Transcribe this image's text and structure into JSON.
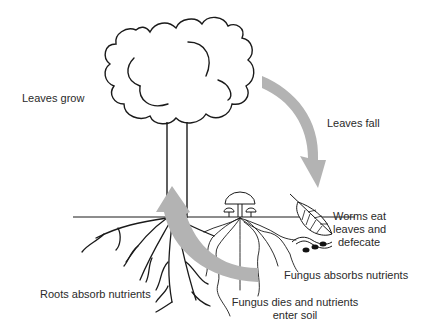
{
  "diagram": {
    "labels": {
      "leaves_grow": "Leaves grow",
      "leaves_fall": "Leaves fall",
      "worms_line1": "Worms eat",
      "worms_line2": "leaves and",
      "worms_line3": "defecate",
      "fungus_absorbs": "Fungus absorbs nutrients",
      "fungus_dies_line1": "Fungus dies and nutrients",
      "fungus_dies_line2": "enter soil",
      "roots_absorb": "Roots absorb nutrients"
    },
    "colors": {
      "line": "#1a1a1a",
      "arrow": "#b3b3b3",
      "background": "#ffffff"
    },
    "elements": [
      "tree-canopy",
      "tree-trunk",
      "ground-line",
      "roots",
      "mushrooms",
      "fungal-hyphae",
      "leaf",
      "worm",
      "worm-droppings",
      "arrow-leaves-fall",
      "arrow-nutrients-up"
    ]
  }
}
